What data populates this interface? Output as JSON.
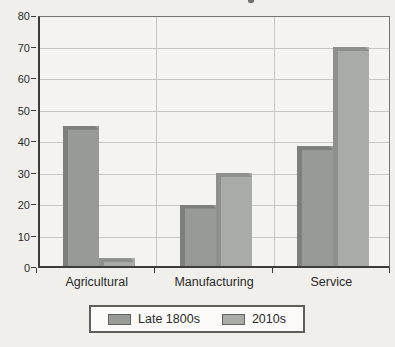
{
  "chart_data": {
    "type": "bar",
    "title": "",
    "xlabel": "",
    "ylabel": "",
    "categories": [
      "Agricultural",
      "Manufacturing",
      "Service"
    ],
    "series": [
      {
        "name": "Late 1800s",
        "values": [
          44.5,
          19.5,
          38
        ],
        "color": "#989a96",
        "edge_color": "#7d7f7b"
      },
      {
        "name": "2010s",
        "values": [
          2.5,
          29.5,
          69.5
        ],
        "color": "#a9aba7",
        "edge_color": "#8e908c"
      }
    ],
    "ylim": [
      0,
      80
    ],
    "yticks": [
      0,
      10,
      20,
      30,
      40,
      50,
      60,
      70,
      80
    ],
    "grid": true,
    "legend_position": "bottom"
  },
  "colors": {
    "page_bg": "#f0efec",
    "plot_bg": "#f4f3f0",
    "gridline": "#c8c8c3",
    "axis": "#3c3c38",
    "plot_border": "#75756f",
    "legend_bg": "#fbfaf8",
    "legend_border": "#5e5e5a",
    "text": "#2a2a28"
  }
}
